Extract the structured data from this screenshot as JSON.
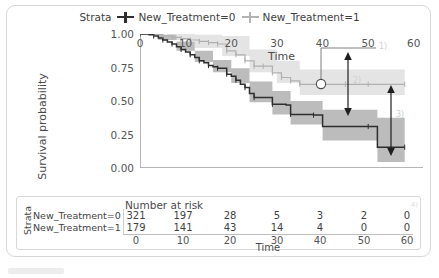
{
  "figure": {
    "type": "kaplan-meier-survival-plot",
    "legend": {
      "title": "Strata",
      "entries": [
        {
          "label": "New_Treatment=0",
          "color": "#2e2e2e",
          "band_color": "#b9b9b9"
        },
        {
          "label": "New_Treatment=1",
          "color": "#b4b4b4",
          "band_color": "#e2e2e2"
        }
      ]
    },
    "annotations": [
      {
        "id": "1",
        "label": "1)",
        "target": "circle-marker-on-curve"
      },
      {
        "id": "2",
        "label": "2)",
        "target": "confidence-interval-arrow-upper"
      },
      {
        "id": "3",
        "label": "3)",
        "target": "confidence-interval-arrow-lower"
      }
    ],
    "risk_table": {
      "title": "Number at risk",
      "strata_label": "Strata",
      "x_title": "Time",
      "time_ticks": [
        0,
        10,
        20,
        30,
        40,
        50,
        60
      ],
      "rows": [
        {
          "label": "New_Treatment=0",
          "counts": [
            321,
            197,
            28,
            5,
            3,
            2,
            0
          ]
        },
        {
          "label": "New_Treatment=1",
          "counts": [
            179,
            141,
            43,
            14,
            4,
            0,
            0
          ]
        }
      ],
      "corner_mark": "4)"
    }
  },
  "chart_data": {
    "type": "line",
    "title": "",
    "xlabel": "Time",
    "ylabel": "Survival probability",
    "xlim": [
      0,
      62
    ],
    "ylim": [
      0.0,
      1.0
    ],
    "xticks": [
      0,
      10,
      20,
      30,
      40,
      50,
      60
    ],
    "yticks": [
      0.0,
      0.25,
      0.5,
      0.75,
      1.0
    ],
    "ytick_labels": [
      "0.00",
      "0.25",
      "0.50",
      "0.75",
      "1.00"
    ],
    "grid": false,
    "legend_position": "top-center",
    "series": [
      {
        "name": "New_Treatment=0",
        "color": "#2e2e2e",
        "band_color": "#b9b9b9",
        "step": [
          [
            0,
            1.0
          ],
          [
            2,
            0.995
          ],
          [
            3,
            0.985
          ],
          [
            4,
            0.97
          ],
          [
            5,
            0.955
          ],
          [
            6,
            0.94
          ],
          [
            7,
            0.925
          ],
          [
            8,
            0.905
          ],
          [
            9,
            0.885
          ],
          [
            10,
            0.865
          ],
          [
            11,
            0.845
          ],
          [
            12,
            0.825
          ],
          [
            13,
            0.8
          ],
          [
            14,
            0.785
          ],
          [
            15,
            0.765
          ],
          [
            16,
            0.755
          ],
          [
            17,
            0.745
          ],
          [
            18,
            0.745
          ],
          [
            19,
            0.7
          ],
          [
            20,
            0.685
          ],
          [
            21,
            0.655
          ],
          [
            22,
            0.625
          ],
          [
            23,
            0.6
          ],
          [
            24,
            0.555
          ],
          [
            25,
            0.525
          ],
          [
            27,
            0.525
          ],
          [
            29,
            0.475
          ],
          [
            32,
            0.47
          ],
          [
            33,
            0.4
          ],
          [
            36,
            0.4
          ],
          [
            38,
            0.395
          ],
          [
            40,
            0.31
          ],
          [
            50,
            0.31
          ],
          [
            52,
            0.155
          ],
          [
            58,
            0.155
          ]
        ],
        "band_lower": [
          [
            0,
            1.0
          ],
          [
            4,
            0.955
          ],
          [
            8,
            0.875
          ],
          [
            12,
            0.79
          ],
          [
            16,
            0.715
          ],
          [
            20,
            0.635
          ],
          [
            24,
            0.49
          ],
          [
            29,
            0.4
          ],
          [
            33,
            0.325
          ],
          [
            40,
            0.205
          ],
          [
            50,
            0.205
          ],
          [
            52,
            0.045
          ],
          [
            58,
            0.045
          ]
        ],
        "band_upper": [
          [
            0,
            1.0
          ],
          [
            4,
            0.995
          ],
          [
            8,
            0.945
          ],
          [
            12,
            0.875
          ],
          [
            16,
            0.805
          ],
          [
            20,
            0.745
          ],
          [
            24,
            0.645
          ],
          [
            29,
            0.575
          ],
          [
            33,
            0.5
          ],
          [
            40,
            0.435
          ],
          [
            50,
            0.435
          ],
          [
            52,
            0.375
          ],
          [
            58,
            0.375
          ]
        ]
      },
      {
        "name": "New_Treatment=1",
        "color": "#b4b4b4",
        "band_color": "#e2e2e2",
        "step": [
          [
            0,
            1.0
          ],
          [
            3,
            0.995
          ],
          [
            5,
            0.985
          ],
          [
            7,
            0.975
          ],
          [
            9,
            0.965
          ],
          [
            11,
            0.955
          ],
          [
            13,
            0.945
          ],
          [
            15,
            0.935
          ],
          [
            17,
            0.925
          ],
          [
            19,
            0.875
          ],
          [
            21,
            0.845
          ],
          [
            23,
            0.8
          ],
          [
            25,
            0.76
          ],
          [
            27,
            0.76
          ],
          [
            29,
            0.71
          ],
          [
            31,
            0.675
          ],
          [
            33,
            0.65
          ],
          [
            35,
            0.625
          ],
          [
            40,
            0.625
          ],
          [
            45,
            0.625
          ],
          [
            50,
            0.625
          ],
          [
            58,
            0.625
          ]
        ],
        "band_lower": [
          [
            0,
            1.0
          ],
          [
            6,
            0.955
          ],
          [
            12,
            0.895
          ],
          [
            18,
            0.835
          ],
          [
            24,
            0.715
          ],
          [
            30,
            0.635
          ],
          [
            35,
            0.545
          ],
          [
            45,
            0.545
          ],
          [
            58,
            0.545
          ]
        ],
        "band_upper": [
          [
            0,
            1.0
          ],
          [
            6,
            1.0
          ],
          [
            12,
            0.995
          ],
          [
            18,
            0.985
          ],
          [
            24,
            0.885
          ],
          [
            30,
            0.8
          ],
          [
            35,
            0.735
          ],
          [
            45,
            0.735
          ],
          [
            58,
            0.735
          ]
        ]
      }
    ],
    "marker_point": {
      "x": 46,
      "y": 0.625,
      "shape": "circle"
    }
  }
}
